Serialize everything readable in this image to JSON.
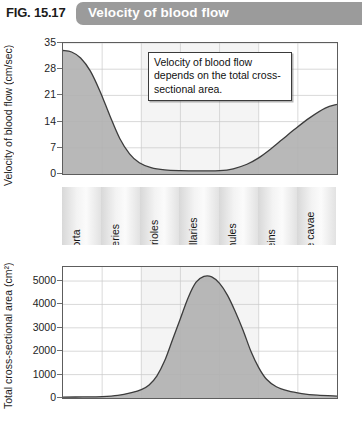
{
  "header": {
    "fig_number": "FIG. 15.17",
    "title": "Velocity of blood flow",
    "banner_color": "#9b9b9b"
  },
  "annotation": {
    "text": "Velocity of blood flow depends on the total cross-sectional area."
  },
  "categories": [
    "Aorta",
    "Arteries",
    "Arterioles",
    "Capillaries",
    "Venules",
    "Veins",
    "Venae cavae"
  ],
  "chart_data": [
    {
      "type": "area",
      "id": "velocity",
      "title": "Velocity of blood flow",
      "xlabel": "",
      "ylabel": "Velocity of blood flow (cm/sec)",
      "ylim": [
        0,
        35
      ],
      "yticks": [
        0,
        7,
        14,
        21,
        28,
        35
      ],
      "ytick_labels": [
        "0",
        "7",
        "14",
        "21",
        "28",
        "35"
      ],
      "grid": true,
      "legend": "none",
      "categories": [
        "Aorta",
        "Arteries",
        "Arterioles",
        "Capillaries",
        "Venules",
        "Veins",
        "Venae cavae"
      ],
      "values": [
        33,
        25,
        4,
        0.8,
        0.8,
        5,
        18
      ],
      "points": [
        {
          "x": 0.0,
          "y": 33.0
        },
        {
          "x": 0.22,
          "y": 32.6
        },
        {
          "x": 0.45,
          "y": 31.0
        },
        {
          "x": 0.7,
          "y": 27.5
        },
        {
          "x": 0.95,
          "y": 22.0
        },
        {
          "x": 1.2,
          "y": 15.5
        },
        {
          "x": 1.45,
          "y": 9.5
        },
        {
          "x": 1.7,
          "y": 5.4
        },
        {
          "x": 1.95,
          "y": 3.0
        },
        {
          "x": 2.25,
          "y": 1.7
        },
        {
          "x": 2.6,
          "y": 1.1
        },
        {
          "x": 3.0,
          "y": 0.9
        },
        {
          "x": 3.5,
          "y": 0.85
        },
        {
          "x": 4.0,
          "y": 0.9
        },
        {
          "x": 4.35,
          "y": 1.4
        },
        {
          "x": 4.7,
          "y": 2.6
        },
        {
          "x": 5.0,
          "y": 4.3
        },
        {
          "x": 5.3,
          "y": 6.6
        },
        {
          "x": 5.6,
          "y": 9.2
        },
        {
          "x": 5.9,
          "y": 11.8
        },
        {
          "x": 6.3,
          "y": 15.0
        },
        {
          "x": 6.7,
          "y": 17.6
        },
        {
          "x": 7.0,
          "y": 18.6
        }
      ],
      "fill_color": "#b0b0b0",
      "line_color": "#3c3c3c"
    },
    {
      "type": "area",
      "id": "cross-sectional-area",
      "title": "Total cross-sectional area",
      "xlabel": "",
      "ylabel": "Total cross-sectional area (cm2)",
      "ylabel_display": "Total cross-sectional area (cm²)",
      "ylim": [
        0,
        5600
      ],
      "yticks": [
        0,
        1000,
        2000,
        3000,
        4000,
        5000
      ],
      "ytick_labels": [
        "0",
        "1000",
        "2000",
        "3000",
        "4000",
        "5000"
      ],
      "grid": true,
      "legend": "none",
      "categories": [
        "Aorta",
        "Arteries",
        "Arterioles",
        "Capillaries",
        "Venules",
        "Veins",
        "Venae cavae"
      ],
      "values": [
        40,
        60,
        900,
        5200,
        1800,
        200,
        90
      ],
      "points": [
        {
          "x": 0.0,
          "y": 40
        },
        {
          "x": 0.5,
          "y": 45
        },
        {
          "x": 1.0,
          "y": 60
        },
        {
          "x": 1.4,
          "y": 110
        },
        {
          "x": 1.75,
          "y": 230
        },
        {
          "x": 2.0,
          "y": 360
        },
        {
          "x": 2.2,
          "y": 560
        },
        {
          "x": 2.4,
          "y": 950
        },
        {
          "x": 2.6,
          "y": 1600
        },
        {
          "x": 2.8,
          "y": 2500
        },
        {
          "x": 3.0,
          "y": 3400
        },
        {
          "x": 3.2,
          "y": 4300
        },
        {
          "x": 3.4,
          "y": 4950
        },
        {
          "x": 3.6,
          "y": 5200
        },
        {
          "x": 3.8,
          "y": 5180
        },
        {
          "x": 4.0,
          "y": 4900
        },
        {
          "x": 4.2,
          "y": 4400
        },
        {
          "x": 4.4,
          "y": 3700
        },
        {
          "x": 4.6,
          "y": 2900
        },
        {
          "x": 4.8,
          "y": 2000
        },
        {
          "x": 5.0,
          "y": 1300
        },
        {
          "x": 5.2,
          "y": 800
        },
        {
          "x": 5.45,
          "y": 480
        },
        {
          "x": 5.75,
          "y": 300
        },
        {
          "x": 6.1,
          "y": 190
        },
        {
          "x": 6.5,
          "y": 120
        },
        {
          "x": 7.0,
          "y": 80
        }
      ],
      "fill_color": "#b0b0b0",
      "line_color": "#3c3c3c"
    }
  ]
}
